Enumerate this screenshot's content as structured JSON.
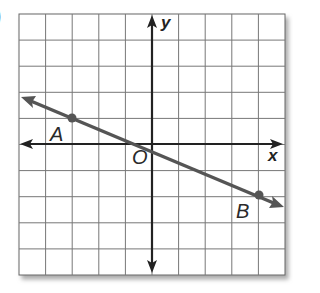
{
  "problem": {
    "marker": ")"
  },
  "graph": {
    "grid": {
      "cols": 10,
      "rows": 10,
      "x_min": -5,
      "x_max": 5,
      "y_min": -5,
      "y_max": 5
    },
    "axes": {
      "x_label": "x",
      "y_label": "y",
      "origin_label": "O"
    },
    "line": {
      "points": [
        {
          "label": "A",
          "x": -3,
          "y": 1
        },
        {
          "label": "B",
          "x": 4,
          "y": -2
        }
      ],
      "color": "#555555"
    }
  }
}
